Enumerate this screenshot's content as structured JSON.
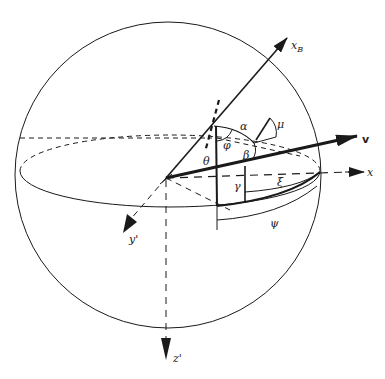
{
  "diagram": {
    "type": "3d-coordinate-sphere",
    "colors": {
      "stroke": "#1a1a1a",
      "background": "#ffffff"
    },
    "axes": {
      "xB": {
        "label": "x",
        "subscript": "B"
      },
      "v": {
        "label": "v"
      },
      "x": {
        "label": "x"
      },
      "y_prime": {
        "label": "y'"
      },
      "z_prime": {
        "label": "z'"
      }
    },
    "angles": {
      "alpha": "α",
      "mu": "μ",
      "phi": "φ",
      "beta": "β",
      "theta": "θ",
      "gamma": "γ",
      "xi": "ξ",
      "psi": "ψ"
    }
  }
}
